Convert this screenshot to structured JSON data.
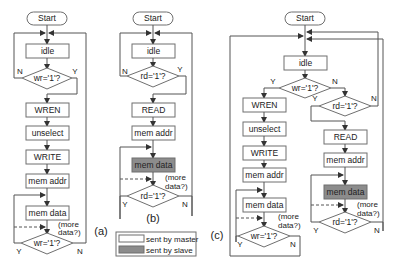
{
  "diagram": {
    "type": "flowchart",
    "colors": {
      "master_fill": "#ffffff",
      "slave_fill": "#8c8c8c",
      "stroke": "#6f6f6f"
    },
    "a": {
      "caption": "(a)",
      "start": "Start",
      "idle": "idle",
      "decision1": "wr='1'?",
      "d1_no": "N",
      "d1_yes": "Y",
      "steps": [
        "WREN",
        "unselect",
        "WRITE",
        "mem addr",
        "mem data"
      ],
      "more_data": "(more data?)",
      "more_data_l1": "(more",
      "more_data_l2": "data?)",
      "decision2": "wr='1'?",
      "d2_yes": "Y",
      "d2_no": "N"
    },
    "b": {
      "caption": "(b)",
      "start": "Start",
      "idle": "idle",
      "decision1": "rd='1'?",
      "d1_no": "N",
      "d1_yes": "Y",
      "steps": [
        "READ",
        "mem addr",
        "mem data"
      ],
      "more_data_l1": "(more",
      "more_data_l2": "data?)",
      "decision2": "rd='1'?",
      "d2_yes": "Y",
      "d2_no": "N"
    },
    "c": {
      "caption": "(c)",
      "start": "Start",
      "idle": "idle",
      "decision_wr": "wr='1'?",
      "wr_yes": "Y",
      "wr_no": "N",
      "decision_rd": "rd='1'?",
      "rd_yes": "Y",
      "rd_no": "N",
      "write_steps": [
        "WREN",
        "unselect",
        "WRITE",
        "mem addr",
        "mem data"
      ],
      "read_steps": [
        "READ",
        "mem addr",
        "mem data"
      ],
      "more_data_l1": "(more",
      "more_data_l2": "data?)",
      "write_loop_decision": "wr='1'?",
      "wl_yes": "Y",
      "wl_no": "N",
      "read_loop_decision": "rd='1'?",
      "rl_yes": "Y",
      "rl_no": "N"
    },
    "legend": {
      "master": "sent by master",
      "slave": "sent by slave"
    }
  }
}
